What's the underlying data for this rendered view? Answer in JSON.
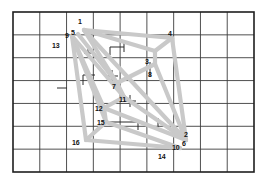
{
  "figure": {
    "background_color": "#ffffff",
    "grid": {
      "x0": 13,
      "y0": 12,
      "x1": 254,
      "y1": 172,
      "columns": 9,
      "rows": 7,
      "line_color": "#3c3c3c",
      "border_color": "#1e1e1e",
      "border_width": 1.6,
      "line_width": 0.9
    },
    "edge_style": {
      "color": "#c9c9c9",
      "width": 4.2,
      "cap": "round"
    },
    "tick_style": {
      "color": "#2b2b2b",
      "width": 1.0
    }
  },
  "nodes": [
    {
      "id": "1",
      "label": "1",
      "x": 84,
      "y": 30,
      "label_x": 78,
      "label_y": 18
    },
    {
      "id": "2",
      "label": "2",
      "x": 186,
      "y": 140,
      "label_x": 184,
      "label_y": 131
    },
    {
      "id": "3",
      "label": "3",
      "x": 155,
      "y": 51,
      "label_x": 145,
      "label_y": 58
    },
    {
      "id": "4",
      "label": "4",
      "x": 172,
      "y": 38,
      "label_x": 168,
      "label_y": 30
    },
    {
      "id": "5",
      "label": "5",
      "x": 78,
      "y": 34,
      "label_x": 71,
      "label_y": 29
    },
    {
      "id": "6",
      "label": "6",
      "x": 186,
      "y": 146,
      "label_x": 182,
      "label_y": 140
    },
    {
      "id": "7",
      "label": "7",
      "x": 117,
      "y": 83,
      "label_x": 112,
      "label_y": 83
    },
    {
      "id": "8",
      "label": "8",
      "x": 155,
      "y": 64,
      "label_x": 148,
      "label_y": 71
    },
    {
      "id": "9",
      "label": "9",
      "x": 72,
      "y": 36,
      "label_x": 65,
      "label_y": 32
    },
    {
      "id": "10",
      "label": "10",
      "x": 180,
      "y": 148,
      "label_x": 172,
      "label_y": 144
    },
    {
      "id": "11",
      "label": "11",
      "x": 124,
      "y": 97,
      "label_x": 119,
      "label_y": 96
    },
    {
      "id": "12",
      "label": "12",
      "x": 104,
      "y": 108,
      "label_x": 95,
      "label_y": 105
    },
    {
      "id": "13",
      "label": "13",
      "x": 64,
      "y": 44,
      "label_x": 52,
      "label_y": 42
    },
    {
      "id": "14",
      "label": "14",
      "x": 166,
      "y": 158,
      "label_x": 158,
      "label_y": 153
    },
    {
      "id": "15",
      "label": "15",
      "x": 106,
      "y": 122,
      "label_x": 97,
      "label_y": 119
    },
    {
      "id": "16",
      "label": "16",
      "x": 86,
      "y": 140,
      "label_x": 72,
      "label_y": 139
    }
  ],
  "edges": [
    {
      "from": "1",
      "to": "3"
    },
    {
      "from": "1",
      "to": "4"
    },
    {
      "from": "1",
      "to": "7"
    },
    {
      "from": "5",
      "to": "7"
    },
    {
      "from": "9",
      "to": "11"
    },
    {
      "from": "9",
      "to": "12"
    },
    {
      "from": "9",
      "to": "15"
    },
    {
      "from": "3",
      "to": "4"
    },
    {
      "from": "3",
      "to": "8"
    },
    {
      "from": "4",
      "to": "2"
    },
    {
      "from": "8",
      "to": "2"
    },
    {
      "from": "7",
      "to": "8"
    },
    {
      "from": "7",
      "to": "11"
    },
    {
      "from": "11",
      "to": "2"
    },
    {
      "from": "12",
      "to": "11"
    },
    {
      "from": "12",
      "to": "15"
    },
    {
      "from": "12",
      "to": "2"
    },
    {
      "from": "15",
      "to": "16"
    },
    {
      "from": "15",
      "to": "10"
    },
    {
      "from": "16",
      "to": "10"
    },
    {
      "from": "9",
      "to": "16"
    },
    {
      "from": "1",
      "to": "2"
    }
  ],
  "ticks": [
    {
      "name": "plus-marker",
      "type": "plus",
      "x": 88,
      "y": 53,
      "size": 4
    },
    {
      "name": "plus-marker",
      "type": "plus",
      "x": 112,
      "y": 76,
      "size": 6
    },
    {
      "name": "plus-marker",
      "type": "plus",
      "x": 130,
      "y": 101,
      "size": 6
    },
    {
      "name": "corner-mark",
      "type": "corner",
      "x": 110,
      "y": 47,
      "w": 14,
      "h": 8,
      "dir": "tl"
    },
    {
      "name": "corner-mark",
      "type": "corner",
      "x": 83,
      "y": 75,
      "w": 12,
      "h": 10,
      "dir": "tl"
    },
    {
      "name": "corner-mark",
      "type": "corner",
      "x": 104,
      "y": 122,
      "w": 34,
      "h": 8,
      "dir": "tr"
    },
    {
      "name": "tick-vertical",
      "type": "vline",
      "x": 150,
      "y": 62,
      "len": 14
    },
    {
      "name": "tick-vertical",
      "type": "vline",
      "x": 158,
      "y": 118,
      "len": 9
    },
    {
      "name": "tick-vertical",
      "type": "vline",
      "x": 124,
      "y": 42,
      "len": 10
    },
    {
      "name": "tick-horizontal",
      "type": "hline",
      "x": 57,
      "y": 88,
      "len": 10
    }
  ]
}
